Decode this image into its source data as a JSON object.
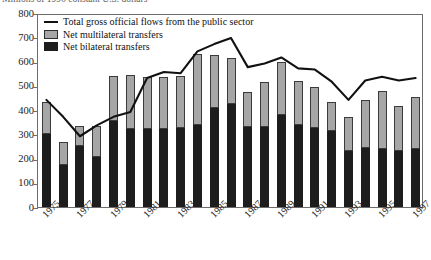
{
  "title": "Millions of 1996 constant U.S. dollars",
  "legend": {
    "items": [
      {
        "key": "line",
        "label": "Total gross official flows from the public sector"
      },
      {
        "key": "multi",
        "label": "Net multilateral transfers"
      },
      {
        "key": "bi",
        "label": "Net bilateral transfers"
      }
    ]
  },
  "axis": {
    "y_ticks": [
      "800",
      "700",
      "600",
      "500",
      "400",
      "300",
      "200",
      "100",
      "0"
    ],
    "x_ticks": [
      "1975",
      "1977",
      "1979",
      "1981",
      "1983",
      "1985",
      "1987",
      "1989",
      "1991",
      "1993",
      "1995",
      "1997"
    ]
  },
  "colors": {
    "bilateral": "#1d1d1d",
    "multilateral": "#a6a6a6",
    "line": "#111111",
    "frame": "#6c6c6c"
  },
  "chart_data": {
    "type": "bar",
    "title": "Millions of 1996 constant U.S. dollars",
    "xlabel": "",
    "ylabel": "",
    "ylim": [
      0,
      800
    ],
    "grid": false,
    "legend_position": "top-left",
    "stacked": true,
    "categories": [
      "1975",
      "1976",
      "1977",
      "1978",
      "1979",
      "1980",
      "1981",
      "1982",
      "1983",
      "1984",
      "1985",
      "1986",
      "1987",
      "1988",
      "1989",
      "1990",
      "1991",
      "1992",
      "1993",
      "1994",
      "1995",
      "1996",
      "1997"
    ],
    "series": [
      {
        "name": "Net bilateral transfers",
        "values": [
          300,
          175,
          250,
          205,
          355,
          320,
          320,
          320,
          325,
          340,
          410,
          425,
          330,
          330,
          380,
          340,
          325,
          315,
          230,
          245,
          240,
          230,
          240
        ]
      },
      {
        "name": "Net multilateral transfers",
        "values": [
          133,
          95,
          85,
          130,
          185,
          225,
          215,
          215,
          215,
          290,
          215,
          190,
          145,
          185,
          220,
          180,
          170,
          120,
          140,
          195,
          240,
          185,
          215
        ]
      }
    ],
    "stack_totals": [
      433,
      270,
      335,
      335,
      540,
      545,
      535,
      535,
      540,
      630,
      625,
      615,
      475,
      515,
      600,
      520,
      495,
      435,
      370,
      440,
      480,
      415,
      455
    ],
    "line_series": {
      "name": "Total gross official flows from the public sector",
      "values": [
        450,
        380,
        300,
        345,
        380,
        400,
        540,
        565,
        560,
        650,
        680,
        705,
        585,
        600,
        625,
        580,
        575,
        525,
        450,
        530,
        545,
        530,
        540
      ]
    }
  }
}
